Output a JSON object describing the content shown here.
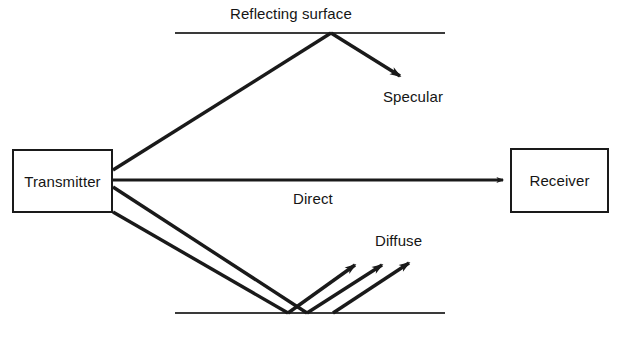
{
  "diagram": {
    "title_text_present": false,
    "nodes": [
      {
        "id": "transmitter",
        "label": "Transmitter"
      },
      {
        "id": "receiver",
        "label": "Receiver"
      }
    ],
    "labels": {
      "reflecting_surface": "Reflecting surface",
      "specular": "Specular",
      "direct": "Direct",
      "diffuse": "Diffuse"
    },
    "colors": {
      "stroke": "#1a1a1a",
      "surface_line": "#3a3a3a",
      "text": "#151515",
      "background": "#ffffff"
    },
    "surfaces": [
      {
        "id": "reflecting-surface-line",
        "x1": 175,
        "y1": 33,
        "x2": 445,
        "y2": 33
      },
      {
        "id": "ground-surface-line",
        "x1": 175,
        "y1": 313,
        "x2": 445,
        "y2": 313
      }
    ],
    "rays": [
      {
        "id": "incident-specular",
        "from": "transmitter",
        "path": "113,170 330,34"
      },
      {
        "id": "reflected-specular",
        "from": "reflecting-surface",
        "path": "330,34 404,80",
        "arrow": true
      },
      {
        "id": "direct-path",
        "from": "transmitter",
        "to": "receiver",
        "path": "113,180 508,180",
        "arrow": true
      },
      {
        "id": "incident-diffuse-upper",
        "from": "transmitter",
        "path": "113,187 307,313"
      },
      {
        "id": "incident-diffuse-lower",
        "from": "transmitter",
        "path": "113,212 288,313"
      },
      {
        "id": "diffuse-ray-1",
        "path": "288,313 360,261",
        "arrow": true
      },
      {
        "id": "diffuse-ray-2",
        "path": "307,313 387,261",
        "arrow": true
      },
      {
        "id": "diffuse-ray-3",
        "path": "333,313 414,259",
        "arrow": true
      }
    ]
  }
}
